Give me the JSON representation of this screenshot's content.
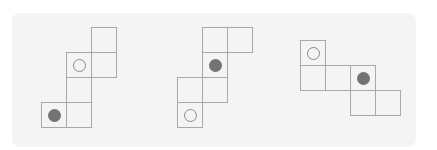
{
  "colors": {
    "panel_bg": "#f4f4f4",
    "grid_line": "#a9a9a9",
    "filled_dot": "#737373",
    "open_dot_outline": "#8a8a8a"
  },
  "cell_size": 26,
  "figures": [
    {
      "name": "net-1",
      "origin": [
        41,
        27
      ],
      "cells": [
        {
          "col": 2,
          "row": 0,
          "mark": "none"
        },
        {
          "col": 1,
          "row": 1,
          "mark": "open"
        },
        {
          "col": 2,
          "row": 1,
          "mark": "none"
        },
        {
          "col": 1,
          "row": 2,
          "mark": "none"
        },
        {
          "col": 0,
          "row": 3,
          "mark": "filled"
        },
        {
          "col": 1,
          "row": 3,
          "mark": "none"
        }
      ]
    },
    {
      "name": "net-2",
      "origin": [
        177,
        27
      ],
      "cells": [
        {
          "col": 1,
          "row": 0,
          "mark": "none"
        },
        {
          "col": 2,
          "row": 0,
          "mark": "none"
        },
        {
          "col": 1,
          "row": 1,
          "mark": "filled"
        },
        {
          "col": 0,
          "row": 2,
          "mark": "none"
        },
        {
          "col": 1,
          "row": 2,
          "mark": "none"
        },
        {
          "col": 0,
          "row": 3,
          "mark": "open"
        }
      ]
    },
    {
      "name": "net-3",
      "origin": [
        300,
        40
      ],
      "cells": [
        {
          "col": 0,
          "row": 0,
          "mark": "open"
        },
        {
          "col": 0,
          "row": 1,
          "mark": "none"
        },
        {
          "col": 1,
          "row": 1,
          "mark": "none"
        },
        {
          "col": 2,
          "row": 1,
          "mark": "filled"
        },
        {
          "col": 2,
          "row": 2,
          "mark": "none"
        },
        {
          "col": 3,
          "row": 2,
          "mark": "none"
        }
      ]
    }
  ]
}
